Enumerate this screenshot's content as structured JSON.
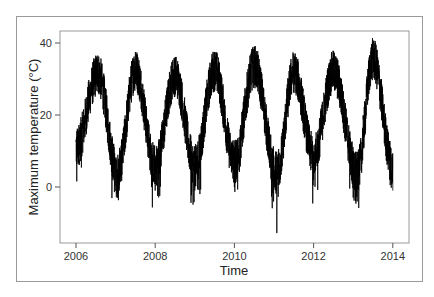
{
  "chart_data": {
    "type": "line",
    "title": "",
    "xlabel": "Time",
    "ylabel": "Maximum temperature (°C)",
    "x_ticks": [
      2006,
      2008,
      2010,
      2012,
      2014
    ],
    "x_tick_labels": [
      "2006",
      "2008",
      "2010",
      "2012",
      "2014"
    ],
    "y_ticks": [
      0,
      20,
      40
    ],
    "y_tick_labels": [
      "0",
      "20",
      "40"
    ],
    "xlim": [
      2005.6,
      2014.4
    ],
    "ylim": [
      -15,
      43.5
    ],
    "grid": false,
    "legend": null,
    "series": [
      {
        "name": "Daily maximum temperature",
        "color": "#000000",
        "resolution": "daily",
        "start": 2006.0,
        "end": 2014.0,
        "annual_peaks": [
          {
            "x": 2006.55,
            "y": 36.5
          },
          {
            "x": 2007.5,
            "y": 37.5
          },
          {
            "x": 2008.5,
            "y": 36.0
          },
          {
            "x": 2009.5,
            "y": 37.5
          },
          {
            "x": 2010.5,
            "y": 38.5
          },
          {
            "x": 2011.5,
            "y": 37.0
          },
          {
            "x": 2012.5,
            "y": 37.0
          },
          {
            "x": 2013.5,
            "y": 40.5
          }
        ],
        "annual_troughs": [
          {
            "x": 2007.05,
            "y": -3.0
          },
          {
            "x": 2008.0,
            "y": -1.0
          },
          {
            "x": 2009.0,
            "y": -1.0
          },
          {
            "x": 2010.0,
            "y": 0.0
          },
          {
            "x": 2011.07,
            "y": -12.8
          },
          {
            "x": 2012.0,
            "y": 2.0
          },
          {
            "x": 2013.1,
            "y": -4.0
          },
          {
            "x": 2014.0,
            "y": -1.0
          }
        ],
        "start_value_range": [
          5,
          15
        ],
        "end_value_range": [
          -1,
          10
        ],
        "annotations": [
          {
            "x": 2011.07,
            "y": -12.8,
            "note": "series minimum"
          },
          {
            "x": 2013.5,
            "y": 40.5,
            "note": "series maximum"
          }
        ]
      }
    ]
  }
}
